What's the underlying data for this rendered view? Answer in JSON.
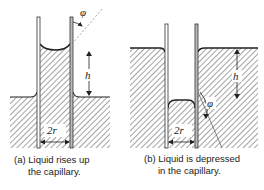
{
  "figure": {
    "panels": [
      {
        "id": "a",
        "caption_line1": "(a) Liquid rises up",
        "caption_line2": "the capillary.",
        "labels": {
          "height": "h",
          "diameter": "2r",
          "angle": "φ"
        }
      },
      {
        "id": "b",
        "caption_line1": "(b) Liquid is depressed",
        "caption_line2": "in the capillary.",
        "labels": {
          "height": "h",
          "diameter": "2r",
          "angle": "φ"
        }
      }
    ]
  }
}
